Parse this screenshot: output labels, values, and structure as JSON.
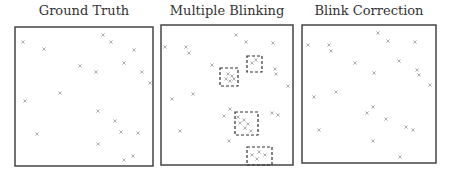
{
  "panels": [
    {
      "title": "Ground Truth",
      "box": {
        "x": 15,
        "y": 27,
        "w": 138,
        "h": 139
      },
      "markers": [
        [
          23,
          42
        ],
        [
          44,
          49
        ],
        [
          103,
          35
        ],
        [
          111,
          42
        ],
        [
          134,
          50
        ],
        [
          80,
          66
        ],
        [
          96,
          72
        ],
        [
          124,
          63
        ],
        [
          142,
          72
        ],
        [
          150,
          83
        ],
        [
          60,
          93
        ],
        [
          25,
          101
        ],
        [
          98,
          111
        ],
        [
          115,
          121
        ],
        [
          121,
          132
        ],
        [
          138,
          133
        ],
        [
          37,
          134
        ],
        [
          98,
          144
        ],
        [
          124,
          160
        ],
        [
          133,
          156
        ]
      ]
    },
    {
      "title": "Multiple Blinking",
      "box": {
        "x": 161,
        "y": 25,
        "w": 132,
        "h": 140
      },
      "markers": [
        [
          165,
          47
        ],
        [
          186,
          47
        ],
        [
          189,
          53
        ],
        [
          246,
          42
        ],
        [
          236,
          35
        ],
        [
          273,
          43
        ],
        [
          212,
          65
        ],
        [
          275,
          69
        ],
        [
          276,
          74
        ],
        [
          288,
          86
        ],
        [
          172,
          99
        ],
        [
          193,
          94
        ],
        [
          230,
          109
        ],
        [
          224,
          116
        ],
        [
          180,
          131
        ],
        [
          229,
          141
        ],
        [
          272,
          113
        ],
        [
          278,
          115
        ],
        [
          228,
          74
        ],
        [
          232,
          76
        ],
        [
          226,
          79
        ],
        [
          230,
          81
        ],
        [
          234,
          79
        ],
        [
          252,
          63
        ],
        [
          256,
          60
        ],
        [
          238,
          117
        ],
        [
          244,
          120
        ],
        [
          240,
          123
        ],
        [
          248,
          124
        ],
        [
          245,
          128
        ],
        [
          251,
          131
        ],
        [
          252,
          155
        ],
        [
          259,
          152
        ],
        [
          265,
          155
        ],
        [
          257,
          159
        ]
      ],
      "dashed_boxes": [
        {
          "x": 220,
          "y": 68,
          "w": 18,
          "h": 18
        },
        {
          "x": 247,
          "y": 56,
          "w": 15,
          "h": 16
        },
        {
          "x": 235,
          "y": 112,
          "w": 23,
          "h": 23
        },
        {
          "x": 247,
          "y": 147,
          "w": 25,
          "h": 18
        }
      ]
    },
    {
      "title": "Blink Correction",
      "box": {
        "x": 302,
        "y": 25,
        "w": 134,
        "h": 138
      },
      "markers": [
        [
          308,
          45
        ],
        [
          329,
          45
        ],
        [
          331,
          51
        ],
        [
          388,
          41
        ],
        [
          378,
          33
        ],
        [
          415,
          42
        ],
        [
          355,
          63
        ],
        [
          399,
          61
        ],
        [
          417,
          70
        ],
        [
          419,
          75
        ],
        [
          430,
          85
        ],
        [
          374,
          73
        ],
        [
          314,
          97
        ],
        [
          336,
          92
        ],
        [
          373,
          107
        ],
        [
          367,
          113
        ],
        [
          319,
          130
        ],
        [
          386,
          119
        ],
        [
          406,
          127
        ],
        [
          413,
          130
        ],
        [
          373,
          141
        ],
        [
          400,
          157
        ]
      ]
    }
  ],
  "colors": {
    "box_border": "#444444",
    "marker": "#9a9a9a",
    "dashed": "#333333",
    "title_text": "#333333"
  }
}
